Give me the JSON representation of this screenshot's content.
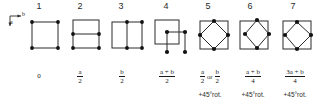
{
  "figure": {
    "axes": {
      "horizontal_label": "b",
      "vertical_label": "a"
    },
    "columns": [
      {
        "number": "1",
        "diagram": "plain-square-lattice",
        "translation_numerator": "0",
        "translation_denominator": "",
        "is_fraction": false,
        "rotation_note": ""
      },
      {
        "number": "2",
        "diagram": "square-with-horizontal-midline",
        "translation_numerator": "a",
        "translation_denominator": "2",
        "is_fraction": true,
        "rotation_note": ""
      },
      {
        "number": "3",
        "diagram": "square-with-vertical-midline",
        "translation_numerator": "b",
        "translation_denominator": "2",
        "is_fraction": true,
        "rotation_note": ""
      },
      {
        "number": "4",
        "diagram": "offset-square-body-centered",
        "translation_numerator": "a + b",
        "translation_denominator": "2",
        "is_fraction": true,
        "rotation_note": ""
      },
      {
        "number": "5",
        "diagram": "square-with-inscribed-diamond-centered",
        "translation_numerator": "a",
        "translation_denominator": "2",
        "is_fraction": true,
        "alt_numerator": "b",
        "alt_denominator": "2",
        "or_text": "or",
        "rotation_note": "+45°rot."
      },
      {
        "number": "6",
        "diagram": "square-with-inscribed-diamond-offset-left",
        "translation_numerator": "a + b",
        "translation_denominator": "4",
        "is_fraction": true,
        "rotation_note": "+45°rot."
      },
      {
        "number": "7",
        "diagram": "square-with-inscribed-diamond-offset-right",
        "translation_numerator": "3a + b",
        "translation_denominator": "4",
        "is_fraction": true,
        "rotation_note": "+45°rot."
      }
    ]
  },
  "style": {
    "line_color": "#2a2a2a",
    "node_color": "#111111",
    "background": "#ffffff"
  }
}
